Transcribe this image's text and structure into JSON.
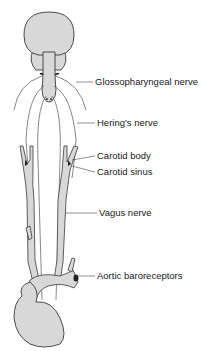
{
  "diagram": {
    "colors": {
      "fill": "#d8d8d8",
      "stroke": "#3a3a3a",
      "nerve": "#555555",
      "leader": "#444444",
      "text": "#1a1a1a"
    },
    "labels": [
      {
        "id": "glossopharyngeal",
        "text": "Glossopharyngeal nerve",
        "x": 95,
        "y": 77
      },
      {
        "id": "herings",
        "text": "Hering's nerve",
        "x": 97,
        "y": 119
      },
      {
        "id": "carotid_body",
        "text": "Carotid body",
        "x": 97,
        "y": 152
      },
      {
        "id": "carotid_sinus",
        "text": "Carotid sinus",
        "x": 97,
        "y": 168
      },
      {
        "id": "vagus",
        "text": "Vagus nerve",
        "x": 99,
        "y": 209
      },
      {
        "id": "aortic",
        "text": "Aortic baroreceptors",
        "x": 97,
        "y": 272
      }
    ]
  }
}
